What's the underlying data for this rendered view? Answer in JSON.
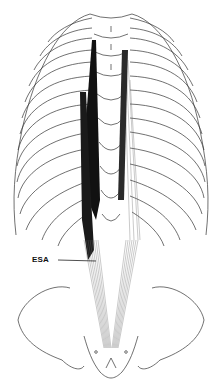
{
  "figure": {
    "labels": [
      {
        "id": "esa",
        "text": "ESA",
        "x": 32,
        "y": 255,
        "leader_to": [
          96,
          261
        ]
      }
    ],
    "colors": {
      "line": "#333333",
      "muscle_dark": "#111111",
      "muscle_fiber": "#555555",
      "background": "#ffffff"
    }
  }
}
